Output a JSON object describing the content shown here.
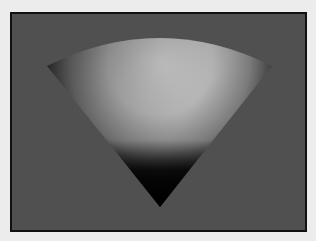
{
  "scene": {
    "subject": "shaded 3D cone (spherical sector)",
    "background_color": "#505050",
    "frame_color": "#111111",
    "page_color": "#ececec",
    "highlight_color": "#cfcfcf",
    "shadow_color": "#050505"
  }
}
